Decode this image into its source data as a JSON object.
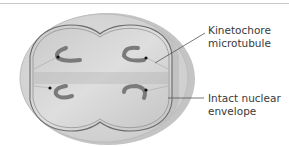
{
  "figure": {
    "labels": [
      {
        "id": "kinetochore-microtubule",
        "lines": [
          "Kinetochore",
          "microtubule"
        ]
      },
      {
        "id": "intact-nuclear-envelope",
        "lines": [
          "Intact nuclear",
          "envelope"
        ]
      }
    ]
  },
  "colors": {
    "cell_outer": "#d6d6d6",
    "cell_rim": "#bdbdbd",
    "nucleus_fill": "#cfcfcf",
    "envelope_line": "#6b6b6b",
    "chromosome": "#7a7a7a",
    "kinetochore_dot": "#111111",
    "leader_line": "#555555",
    "text": "#3a3a3a"
  }
}
